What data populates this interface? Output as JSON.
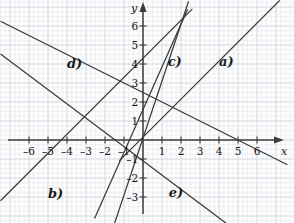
{
  "figure": {
    "kind": "coordinate-plane-line-graph",
    "background_color": "#fdfdfd",
    "minor_grid_color": "#dfe3ea",
    "major_grid_color": "#c9cfd8",
    "axis_color": "#3c3c3c",
    "line_color": "#3a3a3a",
    "text_color": "#111111"
  },
  "axes": {
    "x_label": "x",
    "y_label": "y",
    "origin_px": {
      "x": 143,
      "y": 140
    },
    "unit_px": 19,
    "minor_per_unit": 4,
    "x_range": [
      -7.5,
      7.9
    ],
    "y_range": [
      -4.3,
      7.3
    ],
    "x_ticks": [
      {
        "value": -6,
        "label": "–6"
      },
      {
        "value": -5,
        "label": "–5"
      },
      {
        "value": -4,
        "label": "–4"
      },
      {
        "value": -3,
        "label": "–3"
      },
      {
        "value": -2,
        "label": "–2"
      },
      {
        "value": -1,
        "label": "–1"
      },
      {
        "value": 1,
        "label": "1"
      },
      {
        "value": 2,
        "label": "2"
      },
      {
        "value": 3,
        "label": "3"
      },
      {
        "value": 4,
        "label": "4"
      },
      {
        "value": 5,
        "label": "5"
      },
      {
        "value": 6,
        "label": "6"
      }
    ],
    "y_ticks": [
      {
        "value": 6,
        "label": "6"
      },
      {
        "value": 5,
        "label": "5"
      },
      {
        "value": 4,
        "label": "4"
      },
      {
        "value": 3,
        "label": "3"
      },
      {
        "value": 2,
        "label": "2"
      },
      {
        "value": 1,
        "label": "1"
      },
      {
        "value": -1,
        "label": "–1"
      },
      {
        "value": -2,
        "label": "–2"
      },
      {
        "value": -3,
        "label": "–3"
      }
    ]
  },
  "chart_data": {
    "type": "line",
    "title": "",
    "xlabel": "x",
    "ylabel": "y",
    "xlim": [
      -7.5,
      7.9
    ],
    "ylim": [
      -4.3,
      7.3
    ],
    "grid": true,
    "legend": "inline-labels",
    "series": [
      {
        "name": "a)",
        "label": "a)",
        "slope": 1,
        "intercept": 0.15,
        "label_pos": {
          "x": 4.0,
          "y": 4.45
        },
        "x_from": -1.25,
        "x_to": 7.2
      },
      {
        "name": "b)",
        "label": "b)",
        "slope": 1,
        "intercept": 4.3,
        "label_pos": {
          "x": -5.0,
          "y": -2.45
        },
        "x_from": -7.5,
        "x_to": 2.6
      },
      {
        "name": "c)",
        "label": "c)",
        "slope": 3,
        "intercept": 0.1,
        "label_pos": {
          "x": 1.3,
          "y": 4.45
        },
        "x_from": -1.6,
        "x_to": 2.4
      },
      {
        "name": "d)",
        "label": "d)",
        "slope": -0.5,
        "intercept": 2.5,
        "label_pos": {
          "x": -4.0,
          "y": 4.35
        },
        "x_from": -7.5,
        "x_to": 7.6
      },
      {
        "name": "e)",
        "label": "e)",
        "slope": -0.75,
        "intercept": -1.1,
        "label_pos": {
          "x": 1.35,
          "y": -2.4
        },
        "x_from": -7.5,
        "x_to": 5.3
      },
      {
        "name": "f-steep",
        "label": "",
        "slope": 2.25,
        "intercept": 1.6,
        "label_pos": null,
        "x_from": -2.55,
        "x_to": 2.35
      }
    ]
  }
}
